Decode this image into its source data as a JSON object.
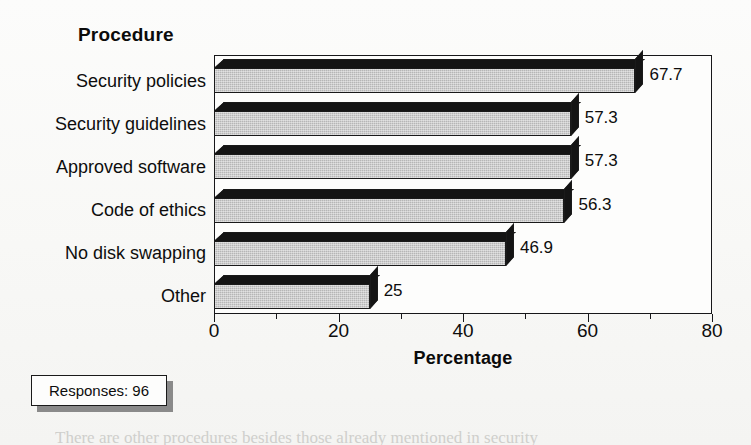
{
  "chart_data": {
    "type": "bar",
    "orientation": "horizontal",
    "title": "Procedure",
    "xlabel": "Percentage",
    "ylabel": "Procedure",
    "categories": [
      "Security policies",
      "Security guidelines",
      "Approved software",
      "Code of ethics",
      "No disk swapping",
      "Other"
    ],
    "values": [
      67.7,
      57.3,
      57.3,
      56.3,
      46.9,
      25
    ],
    "value_labels": [
      "67.7",
      "57.3",
      "57.3",
      "56.3",
      "46.9",
      "25"
    ],
    "xlim": [
      0,
      80
    ],
    "xticks": [
      0,
      20,
      40,
      60,
      80
    ],
    "xtick_labels": [
      "0",
      "20",
      "40",
      "60",
      "80"
    ],
    "minor_xticks": [
      10,
      30,
      50,
      70
    ],
    "grid": false,
    "legend": false,
    "style": "3d-bar",
    "bar_color": "#b6b6b6",
    "bar_edge_color": "#1a1a1a",
    "bar_top_color": "#141414",
    "annotation": "Responses: 96"
  },
  "chart": {
    "category_axis_title": "Procedure",
    "value_axis_title": "Percentage"
  },
  "annotation_box": {
    "label": "Responses: 96"
  },
  "page": {
    "body_text": "There are other procedures besides those already mentioned in security"
  }
}
